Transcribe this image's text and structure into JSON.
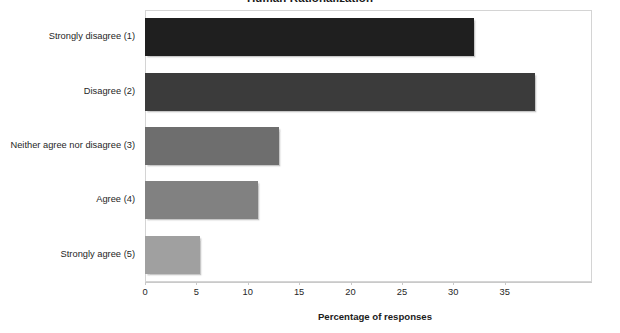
{
  "chart_data": {
    "type": "bar",
    "orientation": "horizontal",
    "title": "Human Rationalization",
    "title_cropped": true,
    "categories": [
      "Strongly disagree (1)",
      "Disagree (2)",
      "Neither agree nor disagree (3)",
      "Agree (4)",
      "Strongly agree (5)"
    ],
    "values": [
      32,
      38,
      13,
      11,
      5.4
    ],
    "xlabel": "Percentage of responses",
    "ylabel": "",
    "xlim": [
      0,
      43.5
    ],
    "xticks": [
      0,
      5,
      10,
      15,
      20,
      25,
      30,
      35
    ],
    "xtick_labels": [
      "0",
      "5",
      "10",
      "15",
      "20",
      "25",
      "30",
      "35"
    ],
    "grid": false,
    "legend": false,
    "bar_colors": [
      "#1f1f1f",
      "#3b3b3b",
      "#6e6e6e",
      "#818181",
      "#a0a0a0"
    ],
    "frame_color": "#d4d4d4",
    "axis_color": "#c9c9c9"
  }
}
